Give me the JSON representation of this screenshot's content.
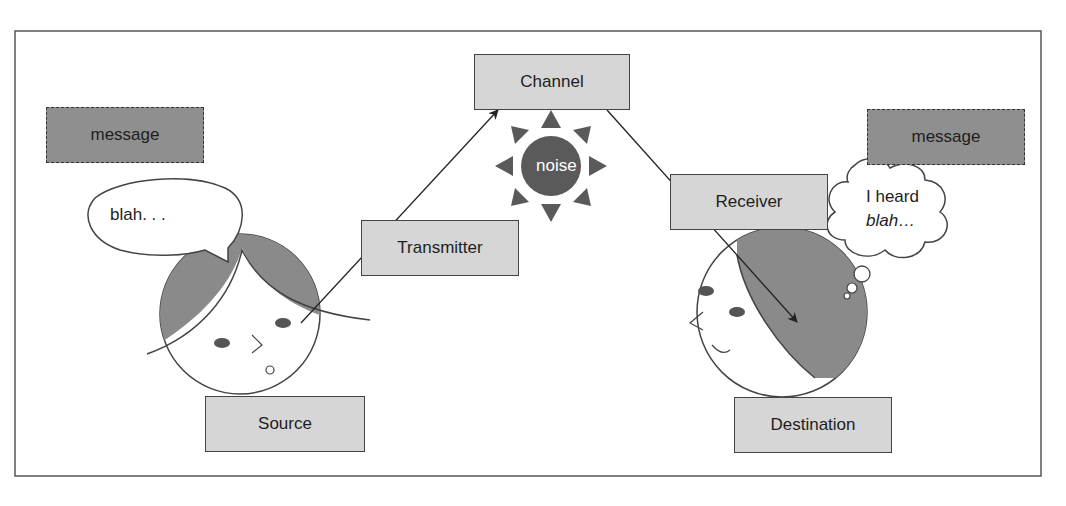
{
  "diagram": {
    "title": "",
    "colors": {
      "box_fill": "#d6d6d6",
      "message_fill": "#8f8f8f",
      "hair": "#8a8a8a",
      "noise": "#5a5a5a",
      "line": "#222222"
    },
    "nodes": {
      "channel": "Channel",
      "transmitter": "Transmitter",
      "receiver": "Receiver",
      "source": "Source",
      "destination": "Destination",
      "noise": "noise",
      "message_left": "message",
      "message_right": "message"
    },
    "bubbles": {
      "speech": "blah. . .",
      "thought_line1": "I heard",
      "thought_line2": "blah…"
    },
    "edges": [
      {
        "from": "source",
        "to": "channel",
        "via": "transmitter"
      },
      {
        "from": "channel",
        "to": "destination",
        "via": "receiver"
      }
    ]
  }
}
